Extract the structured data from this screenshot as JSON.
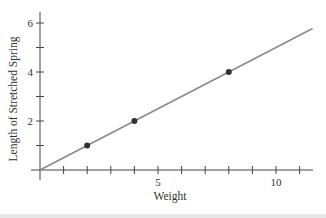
{
  "chart_data": {
    "type": "scatter",
    "title": "",
    "xlabel": "Weight",
    "ylabel": "Length of Stretched Spring",
    "xlim": [
      0,
      11.6
    ],
    "ylim": [
      0,
      6.3
    ],
    "xticks": [
      1,
      2,
      3,
      4,
      5,
      6,
      7,
      8,
      9,
      10,
      11
    ],
    "xtick_labels": {
      "5": "5",
      "10": "10"
    },
    "yticks": [
      1,
      2,
      3,
      4,
      5,
      6
    ],
    "ytick_labels": {
      "2": "2",
      "4": "4",
      "6": "6"
    },
    "grid": false,
    "legend": null,
    "series": [
      {
        "name": "measured points",
        "kind": "scatter",
        "x": [
          2,
          4,
          8
        ],
        "y": [
          1,
          2,
          4
        ],
        "color": "#333333"
      },
      {
        "name": "fit line",
        "kind": "line",
        "x": [
          0,
          11.55
        ],
        "y": [
          0,
          5.775
        ],
        "color": "#8a8a8a"
      }
    ]
  },
  "colors": {
    "axis": "#444444",
    "line": "#8a8a8a",
    "point": "#333333",
    "text": "#333333"
  }
}
